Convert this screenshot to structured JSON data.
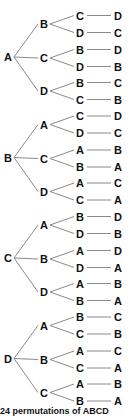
{
  "diagram": {
    "type": "tree-diagram",
    "trees": [
      {
        "root": "A",
        "branches": [
          {
            "node": "B",
            "children": [
              {
                "node": "C",
                "leaf": "D"
              },
              {
                "node": "D",
                "leaf": "C"
              }
            ]
          },
          {
            "node": "C",
            "children": [
              {
                "node": "B",
                "leaf": "D"
              },
              {
                "node": "D",
                "leaf": "B"
              }
            ]
          },
          {
            "node": "D",
            "children": [
              {
                "node": "B",
                "leaf": "C"
              },
              {
                "node": "C",
                "leaf": "B"
              }
            ]
          }
        ]
      },
      {
        "root": "B",
        "branches": [
          {
            "node": "A",
            "children": [
              {
                "node": "C",
                "leaf": "D"
              },
              {
                "node": "D",
                "leaf": "C"
              }
            ]
          },
          {
            "node": "C",
            "children": [
              {
                "node": "A",
                "leaf": "B"
              },
              {
                "node": "B",
                "leaf": "A"
              }
            ]
          },
          {
            "node": "D",
            "children": [
              {
                "node": "A",
                "leaf": "C"
              },
              {
                "node": "C",
                "leaf": "A"
              }
            ]
          }
        ]
      },
      {
        "root": "C",
        "branches": [
          {
            "node": "A",
            "children": [
              {
                "node": "B",
                "leaf": "D"
              },
              {
                "node": "D",
                "leaf": "B"
              }
            ]
          },
          {
            "node": "B",
            "children": [
              {
                "node": "A",
                "leaf": "D"
              },
              {
                "node": "D",
                "leaf": "A"
              }
            ]
          },
          {
            "node": "D",
            "children": [
              {
                "node": "A",
                "leaf": "B"
              },
              {
                "node": "B",
                "leaf": "A"
              }
            ]
          }
        ]
      },
      {
        "root": "D",
        "branches": [
          {
            "node": "A",
            "children": [
              {
                "node": "B",
                "leaf": "C"
              },
              {
                "node": "C",
                "leaf": "B"
              }
            ]
          },
          {
            "node": "B",
            "children": [
              {
                "node": "A",
                "leaf": "C"
              },
              {
                "node": "C",
                "leaf": "A"
              }
            ]
          },
          {
            "node": "C",
            "children": [
              {
                "node": "A",
                "leaf": "B"
              },
              {
                "node": "B",
                "leaf": "A"
              }
            ]
          }
        ]
      }
    ]
  },
  "caption": "24 permutations of ABCD"
}
